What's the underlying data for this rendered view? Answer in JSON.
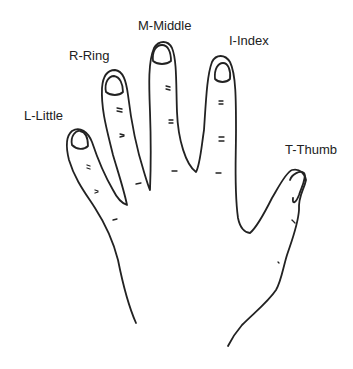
{
  "diagram": {
    "labels": {
      "little": "L-Little",
      "ring": "R-Ring",
      "middle": "M-Middle",
      "index": "I-Index",
      "thumb": "T-Thumb"
    },
    "line_color": "#222222"
  }
}
